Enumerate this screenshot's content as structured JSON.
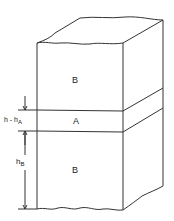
{
  "diagram": {
    "regions": [
      {
        "id": "top-B",
        "label": "B"
      },
      {
        "id": "middle-A",
        "label": "A"
      },
      {
        "id": "bottom-B",
        "label": "B"
      }
    ],
    "dimensions": {
      "layer_A_label": "h - h",
      "layer_A_sub": "A",
      "bottom_B_label": "h",
      "bottom_B_sub": "B"
    },
    "colors": {
      "line": "#333333",
      "background": "#ffffff"
    }
  }
}
